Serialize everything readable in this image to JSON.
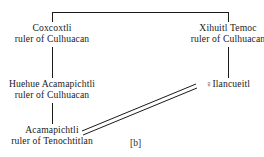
{
  "figure": {
    "label": "[b]",
    "type": "genealogy-chart"
  },
  "nodes": {
    "coxcoxtli": {
      "name": "Coxcoxtli",
      "title": "ruler of Culhuacan"
    },
    "xihuitl_temoc": {
      "name": "Xihuitl Temoc",
      "title": "ruler of Culhuacan"
    },
    "huehue_acamapichtli": {
      "name": "Huehue Acamapichtli",
      "title": "ruler of Culhuacan"
    },
    "ilancueitl": {
      "gender_symbol": "♀",
      "name": "Ilancueitl",
      "title": ""
    },
    "acamapichtli": {
      "name": "Acamapichtli",
      "title": "ruler of Tenochtitlan"
    }
  },
  "colors": {
    "line": "#1a1a1a",
    "text": "#1a1a1a",
    "background": "#ffffff"
  }
}
